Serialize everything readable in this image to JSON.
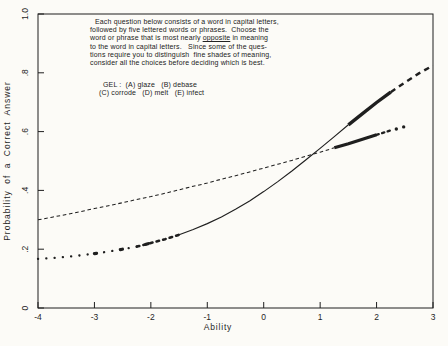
{
  "colors": {
    "ink": "#1f1f1f",
    "paper": "#fcfbf7"
  },
  "directions": {
    "line1": "Each question below consists of a word in capital letters,",
    "line2": "followed by five lettered words or phrases.  Choose the",
    "line3_pre": "word or phrase that is most nearly ",
    "line3_underlined": "opposite",
    "line3_post": " in meaning",
    "line4": "to the word in capital letters.   Since some of the ques-",
    "line5": "tions require you to distinguish  fine shades of meaning,",
    "line6": "consider all the choices before deciding which is best.",
    "example_line1": "GEL :  (A) glaze   (B) debase",
    "example_line2": "(C) corrode   (D) melt   (E) infect"
  },
  "chart_data": {
    "type": "line",
    "title": "",
    "xlabel": "Ability",
    "ylabel": "Probability  of  a  Correct  Answer",
    "xlim": [
      -4,
      3
    ],
    "ylim": [
      0,
      1
    ],
    "grid": false,
    "legend": "none",
    "x_ticks": [
      {
        "v": -4,
        "label": "-4"
      },
      {
        "v": -3,
        "label": "-3"
      },
      {
        "v": -2,
        "label": "-2"
      },
      {
        "v": -1,
        "label": "-1"
      },
      {
        "v": 0,
        "label": "0"
      },
      {
        "v": 1,
        "label": "1"
      },
      {
        "v": 2,
        "label": "2"
      },
      {
        "v": 3,
        "label": "3"
      }
    ],
    "y_ticks": [
      {
        "v": 0,
        "label": "0"
      },
      {
        "v": 0.2,
        "label": ".2"
      },
      {
        "v": 0.4,
        "label": ".4"
      },
      {
        "v": 0.6,
        "label": ".6"
      },
      {
        "v": 0.8,
        "label": ".8"
      },
      {
        "v": 1.0,
        "label": "1.0"
      }
    ],
    "series": [
      {
        "name": "high-discrimination-item-icc",
        "points": [
          [
            -4.0,
            0.167
          ],
          [
            -3.75,
            0.17
          ],
          [
            -3.5,
            0.174
          ],
          [
            -3.25,
            0.179
          ],
          [
            -3.0,
            0.185
          ],
          [
            -2.75,
            0.192
          ],
          [
            -2.5,
            0.2
          ],
          [
            -2.25,
            0.209
          ],
          [
            -2.0,
            0.221
          ],
          [
            -1.75,
            0.234
          ],
          [
            -1.5,
            0.249
          ],
          [
            -1.25,
            0.267
          ],
          [
            -1.0,
            0.287
          ],
          [
            -0.75,
            0.31
          ],
          [
            -0.5,
            0.336
          ],
          [
            -0.25,
            0.364
          ],
          [
            0.0,
            0.396
          ],
          [
            0.25,
            0.43
          ],
          [
            0.5,
            0.466
          ],
          [
            0.75,
            0.504
          ],
          [
            1.0,
            0.543
          ],
          [
            1.25,
            0.583
          ],
          [
            1.5,
            0.623
          ],
          [
            1.75,
            0.661
          ],
          [
            2.0,
            0.699
          ],
          [
            2.25,
            0.734
          ],
          [
            2.5,
            0.767
          ],
          [
            2.75,
            0.798
          ],
          [
            3.0,
            0.825
          ]
        ],
        "segments": [
          {
            "from": -4.0,
            "to": -2.25,
            "width": 2.3,
            "dash": "0.1 8.2",
            "cap": "round"
          },
          {
            "from": -2.25,
            "to": -1.5,
            "width": 2.6,
            "dash": "2.6 4.2",
            "cap": "round"
          },
          {
            "from": -3.05,
            "to": -1.55,
            "width": 3.2,
            "dash": "2.2 24",
            "cap": "round"
          },
          {
            "from": -1.5,
            "to": 1.5,
            "width": 1.15
          },
          {
            "from": 1.5,
            "to": 2.25,
            "width": 3.4
          },
          {
            "from": 2.25,
            "to": 3.0,
            "width": 2.5,
            "dash": "5.5 4.5"
          }
        ],
        "markers": []
      },
      {
        "name": "low-discrimination-item-icc",
        "points": [
          [
            -4.0,
            0.3
          ],
          [
            -3.75,
            0.309
          ],
          [
            -3.5,
            0.318
          ],
          [
            -3.25,
            0.328
          ],
          [
            -3.0,
            0.338
          ],
          [
            -2.75,
            0.348
          ],
          [
            -2.5,
            0.358
          ],
          [
            -2.25,
            0.369
          ],
          [
            -2.0,
            0.379
          ],
          [
            -1.75,
            0.39
          ],
          [
            -1.5,
            0.402
          ],
          [
            -1.25,
            0.414
          ],
          [
            -1.0,
            0.425
          ],
          [
            -0.75,
            0.438
          ],
          [
            -0.5,
            0.45
          ],
          [
            -0.25,
            0.463
          ],
          [
            0.0,
            0.476
          ],
          [
            0.25,
            0.489
          ],
          [
            0.5,
            0.502
          ],
          [
            0.75,
            0.516
          ],
          [
            1.0,
            0.53
          ],
          [
            1.25,
            0.545
          ],
          [
            1.5,
            0.559
          ],
          [
            1.75,
            0.574
          ],
          [
            2.0,
            0.589
          ],
          [
            2.25,
            0.604
          ],
          [
            2.5,
            0.62
          ]
        ],
        "segments": [
          {
            "from": -4.0,
            "to": 1.25,
            "width": 1.05,
            "dash": "3.6 2.7"
          },
          {
            "from": 1.25,
            "to": 2.0,
            "width": 3.2
          },
          {
            "from": 2.0,
            "to": 2.25,
            "width": 2.4,
            "dash": "2.2 3.6",
            "cap": "round"
          }
        ],
        "markers": [
          [
            2.35,
            0.609
          ],
          [
            2.48,
            0.616
          ]
        ]
      }
    ]
  }
}
